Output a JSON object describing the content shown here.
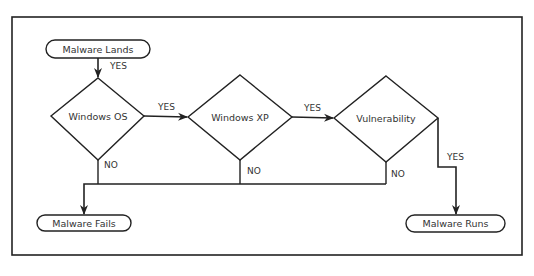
{
  "diagram": {
    "nodes": {
      "malware_lands": "Malware Lands",
      "windows_os": "Windows OS",
      "windows_xp": "Windows XP",
      "vulnerability": "Vulnerability",
      "malware_fails": "Malware Fails",
      "malware_runs": "Malware Runs"
    },
    "edges": {
      "lands_to_os": "YES",
      "os_to_xp": "YES",
      "xp_to_vuln": "YES",
      "vuln_to_runs": "YES",
      "os_no": "NO",
      "xp_no": "NO",
      "vuln_no": "NO"
    }
  },
  "colors": {
    "stroke": "#222222",
    "text": "#333333",
    "background": "#ffffff"
  }
}
